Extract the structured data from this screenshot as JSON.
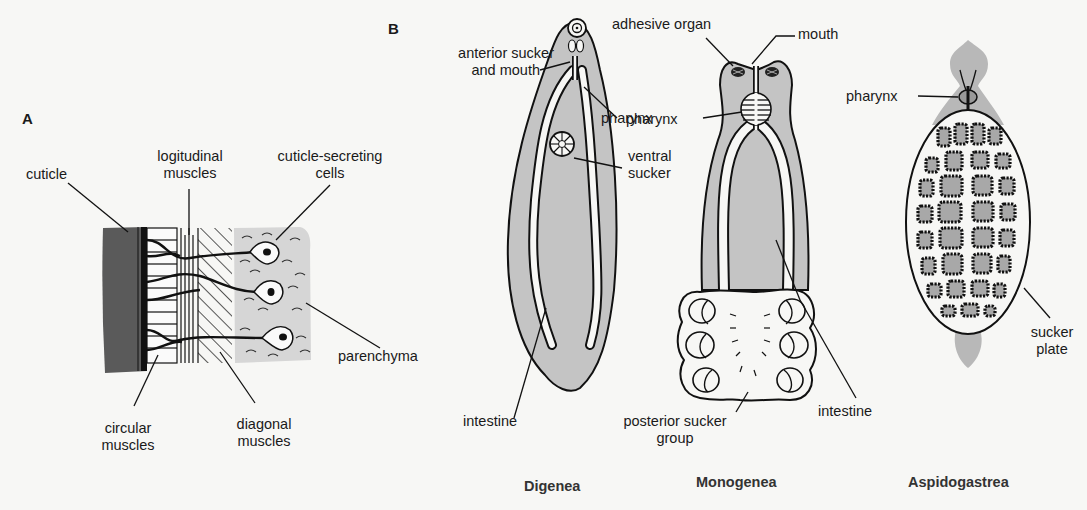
{
  "panels": {
    "A": {
      "letter": "A",
      "labels": {
        "cuticle": "cuticle",
        "longitudinal_1": "logitudinal",
        "longitudinal_2": "muscles",
        "secreting_1": "cuticle-secreting",
        "secreting_2": "cells",
        "parenchyma": "parenchyma",
        "circular_1": "circular",
        "circular_2": "muscles",
        "diagonal_1": "diagonal",
        "diagonal_2": "muscles"
      }
    },
    "B": {
      "letter": "B",
      "digenea": {
        "caption": "Digenea",
        "labels": {
          "anterior_1": "anterior sucker",
          "anterior_2": "and mouth",
          "pharynx": "pharynx",
          "ventral_1": "ventral",
          "ventral_2": "sucker",
          "intestine": "intestine"
        }
      },
      "monogenea": {
        "caption": "Monogenea",
        "labels": {
          "adhesive": "adhesive organ",
          "mouth": "mouth",
          "pharynx": "pharynx",
          "posterior_1": "posterior sucker",
          "posterior_2": "group",
          "intestine": "intestine"
        }
      },
      "aspidogastrea": {
        "caption": "Aspidogastrea",
        "labels": {
          "pharynx": "pharynx",
          "sucker_1": "sucker",
          "sucker_2": "plate"
        }
      }
    }
  },
  "colors": {
    "background": "#f7f7f5",
    "tissue_gray": "#c4c4c4",
    "cuticle_dark": "#5a5a5a",
    "parenchyma_light": "#d6d6d6",
    "ink": "#111111"
  }
}
